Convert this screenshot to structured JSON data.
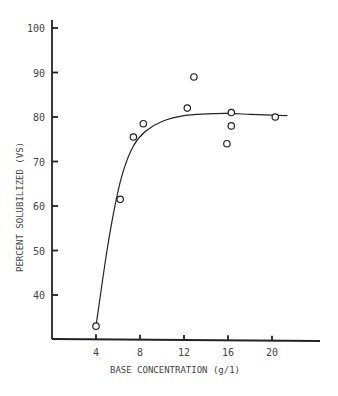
{
  "chart_data": {
    "type": "scatter",
    "title": "",
    "xlabel": "BASE CONCENTRATION (g/1)",
    "ylabel": "PERCENT SOLUBILIZED (VS)",
    "xlim": [
      0,
      24
    ],
    "ylim": [
      30,
      100
    ],
    "x_ticks": [
      4,
      8,
      12,
      16,
      20
    ],
    "y_ticks": [
      40,
      50,
      60,
      70,
      80,
      90,
      100
    ],
    "x_tick_labels": [
      "4",
      "8",
      "12",
      "16",
      "20"
    ],
    "y_tick_labels": [
      "40",
      "50",
      "60",
      "70",
      "80",
      "90",
      "100"
    ],
    "grid": false,
    "legend": "none",
    "series": [
      {
        "name": "observed",
        "marker": "open-circle",
        "points": [
          {
            "x": 4.0,
            "y": 33
          },
          {
            "x": 6.2,
            "y": 61.5
          },
          {
            "x": 7.4,
            "y": 75.5
          },
          {
            "x": 8.3,
            "y": 78.5
          },
          {
            "x": 12.3,
            "y": 82
          },
          {
            "x": 12.9,
            "y": 89
          },
          {
            "x": 15.9,
            "y": 74
          },
          {
            "x": 16.3,
            "y": 78
          },
          {
            "x": 16.3,
            "y": 81
          },
          {
            "x": 20.3,
            "y": 80
          }
        ]
      },
      {
        "name": "fitted curve",
        "type": "line",
        "points": [
          {
            "x": 4.0,
            "y": 33
          },
          {
            "x": 5.0,
            "y": 50
          },
          {
            "x": 5.8,
            "y": 61
          },
          {
            "x": 6.5,
            "y": 68
          },
          {
            "x": 7.4,
            "y": 73.5
          },
          {
            "x": 8.5,
            "y": 76.8
          },
          {
            "x": 10.0,
            "y": 79.0
          },
          {
            "x": 12.0,
            "y": 80.3
          },
          {
            "x": 14.0,
            "y": 80.7
          },
          {
            "x": 16.0,
            "y": 80.8
          },
          {
            "x": 18.0,
            "y": 80.6
          },
          {
            "x": 20.0,
            "y": 80.4
          },
          {
            "x": 21.4,
            "y": 80.3
          }
        ]
      }
    ]
  }
}
